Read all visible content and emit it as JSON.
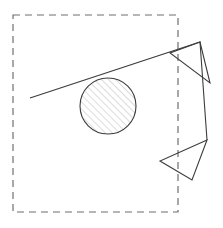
{
  "figure": {
    "canvas": {
      "width": 223,
      "height": 228,
      "background": "#ffffff"
    },
    "colors": {
      "outline": "#3c3c3c",
      "dashed_boundary": "#6e6e6e",
      "hatch": "#9a9a9a",
      "background": "#ffffff"
    },
    "boundary_rect": {
      "name": "dashed-boundary-rectangle",
      "x": 13,
      "y": 15,
      "width": 165,
      "height": 197,
      "stroke": "#6e6e6e",
      "stroke_width": 1.2,
      "dash_pattern": "7,5",
      "fill": "none"
    },
    "main_triangle": {
      "name": "main-open-wedge",
      "apex": [
        30,
        98
      ],
      "upper_end": [
        200,
        42
      ],
      "lower_end": [
        207,
        140
      ],
      "stroke": "#3c3c3c",
      "stroke_width": 1.1,
      "points": "30,98 200,42 207,140"
    },
    "upper_arrow_triangle": {
      "name": "upper-right-arrowhead",
      "points": "200,42 170,53 210,83",
      "stroke": "#3c3c3c",
      "stroke_width": 1.1,
      "fill": "none"
    },
    "lower_arrow_triangle": {
      "name": "lower-right-arrowhead",
      "points": "207,140 160,161 192,180",
      "stroke": "#3c3c3c",
      "stroke_width": 1.1,
      "fill": "none"
    },
    "hatched_circle": {
      "name": "hatched-inscribed-circle",
      "cx": 108,
      "cy": 106,
      "r": 28,
      "stroke": "#3c3c3c",
      "stroke_width": 1.1,
      "fill": "hatch-pattern",
      "hatch_angle_deg": 45,
      "hatch_spacing_px": 5,
      "hatch_color": "#9a9a9a"
    }
  }
}
